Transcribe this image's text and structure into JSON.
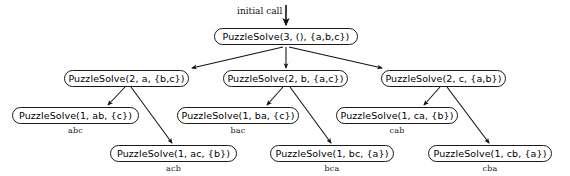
{
  "diagram": {
    "caption": "initial call",
    "nodes": {
      "root": "PuzzleSolve(3, (), {a,b,c})",
      "l2_a": "PuzzleSolve(2, a, {b,c})",
      "l2_b": "PuzzleSolve(2, b, {a,c})",
      "l2_c": "PuzzleSolve(2, c, {a,b})",
      "l3_ab": "PuzzleSolve(1, ab, {c})",
      "l3_ac": "PuzzleSolve(1, ac, {b})",
      "l3_ba": "PuzzleSolve(1, ba, {c})",
      "l3_bc": "PuzzleSolve(1, bc, {a})",
      "l3_ca": "PuzzleSolve(1, ca, {b})",
      "l3_cb": "PuzzleSolve(1, cb, {a})"
    },
    "results": {
      "abc": "abc",
      "acb": "acb",
      "bac": "bac",
      "bca": "bca",
      "cab": "cab",
      "cba": "cba"
    }
  }
}
